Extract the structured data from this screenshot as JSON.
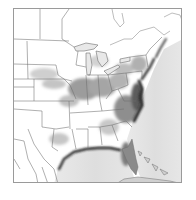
{
  "map": {
    "region": "Eastern United States",
    "style": "grayscale intensity field with state boundaries",
    "colors": {
      "land_background": "#ffffff",
      "ocean": "#e4e4e4",
      "boundary": "#6e6e6e",
      "low_intensity": "#dcdcdc",
      "mid_intensity": "#a8a8a8",
      "high_intensity": "#3a3a3a",
      "frame": "#9a9a9a"
    },
    "features": [
      "Great Lakes",
      "Gulf of Mexico",
      "Atlantic Ocean",
      "Florida peninsula",
      "Bahamas / Cuba",
      "state boundaries"
    ]
  }
}
